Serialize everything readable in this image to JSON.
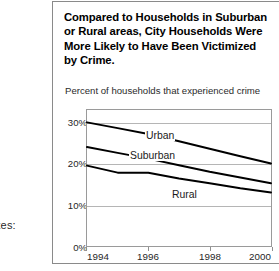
{
  "left_cut_caption": "ates:",
  "figure": {
    "title": "Compared to Households in Suburban or Rural areas, City Households Were More Likely to Have Been Victimized by Crime.",
    "axis_caption": "Percent of households that experienced crime"
  },
  "chart_data": {
    "type": "line",
    "title": "Compared to Households in Suburban or Rural areas, City Households Were More Likely to Have Been Victimized by Crime.",
    "ylabel": "Percent of households that experienced crime",
    "xlabel": "",
    "x": [
      1994,
      1995,
      1996,
      1997,
      1998,
      1999,
      2000
    ],
    "xlim": [
      1994,
      2000
    ],
    "ylim": [
      0,
      33
    ],
    "yticks": [
      0,
      10,
      20,
      30
    ],
    "ytick_labels": [
      "0%",
      "10%",
      "20%",
      "30%"
    ],
    "xticks": [
      1994,
      1996,
      1998,
      2000
    ],
    "xtick_labels": [
      "1994",
      "1996",
      "1998",
      "2000"
    ],
    "grid": true,
    "legend": "inline-labels",
    "series": [
      {
        "name": "Urban",
        "label": "Urban",
        "color": "#000000",
        "values": [
          30.0,
          28.6,
          27.2,
          25.4,
          23.6,
          21.8,
          20.0
        ]
      },
      {
        "name": "Suburban",
        "label": "Suburban",
        "color": "#000000",
        "values": [
          24.0,
          22.6,
          21.2,
          19.6,
          18.0,
          16.6,
          15.2
        ]
      },
      {
        "name": "Rural",
        "label": "Rural",
        "color": "#000000",
        "values": [
          19.5,
          17.8,
          17.8,
          16.4,
          15.2,
          14.0,
          13.0
        ]
      }
    ]
  }
}
